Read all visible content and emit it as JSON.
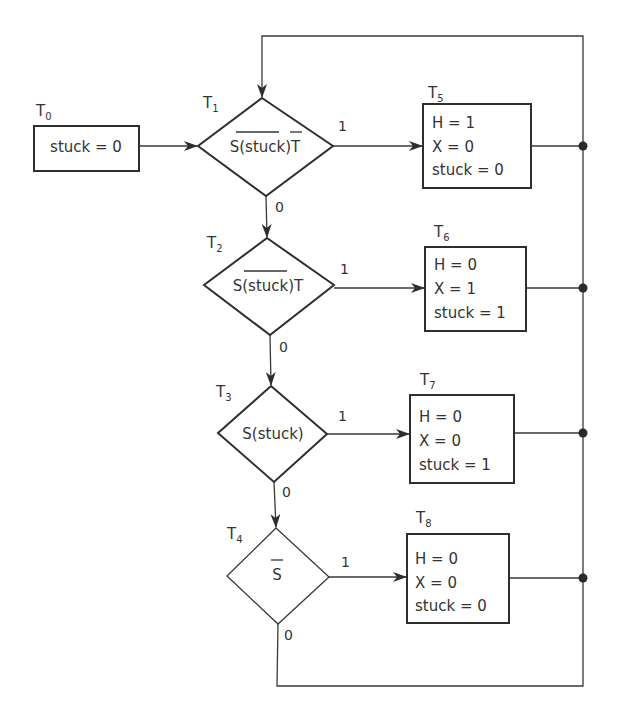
{
  "diagram": {
    "type": "flowchart",
    "start": {
      "id": "T0",
      "label": "T",
      "sub": "0",
      "action": "stuck = 0"
    },
    "decisions": [
      {
        "id": "T1",
        "label": "T",
        "sub": "1",
        "condition_prefix": "S(",
        "condition_bar": "stuck",
        "condition_mid": ")",
        "condition_bar2": "T",
        "condition_suffix": "",
        "yes": "1",
        "no": "0"
      },
      {
        "id": "T2",
        "label": "T",
        "sub": "2",
        "condition_prefix": "S(",
        "condition_bar": "stuck",
        "condition_mid": ")T",
        "condition_bar2": "",
        "condition_suffix": "",
        "yes": "1",
        "no": "0"
      },
      {
        "id": "T3",
        "label": "T",
        "sub": "3",
        "condition_prefix": "S(stuck)",
        "condition_bar": "",
        "condition_mid": "",
        "condition_bar2": "",
        "condition_suffix": "",
        "yes": "1",
        "no": "0"
      },
      {
        "id": "T4",
        "label": "T",
        "sub": "4",
        "condition_prefix": "",
        "condition_bar": "S",
        "condition_mid": "",
        "condition_bar2": "",
        "condition_suffix": "",
        "yes": "1",
        "no": "0"
      }
    ],
    "actions": [
      {
        "id": "T5",
        "label": "T",
        "sub": "5",
        "lines": [
          "H = 1",
          "X = 0",
          "stuck = 0"
        ]
      },
      {
        "id": "T6",
        "label": "T",
        "sub": "6",
        "lines": [
          "H = 0",
          "X = 1",
          "stuck = 1"
        ]
      },
      {
        "id": "T7",
        "label": "T",
        "sub": "7",
        "lines": [
          "H = 0",
          "X = 0",
          "stuck = 1"
        ]
      },
      {
        "id": "T8",
        "label": "T",
        "sub": "8",
        "lines": [
          "H = 0",
          "X = 0",
          "stuck = 0"
        ]
      }
    ],
    "colors": {
      "stroke": "#2e2e2e",
      "text": "#333333",
      "background": "#ffffff"
    }
  }
}
